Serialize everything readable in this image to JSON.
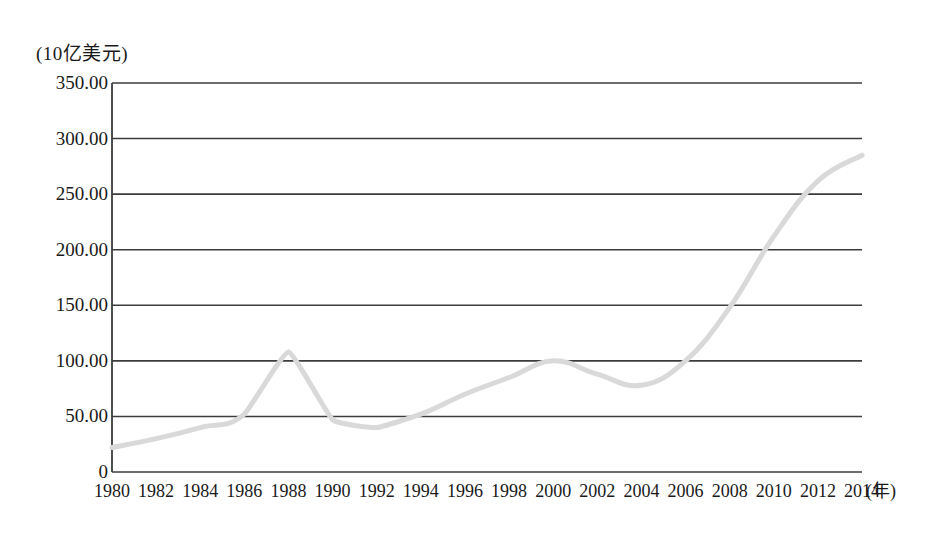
{
  "chart_data": {
    "type": "line",
    "title": "",
    "subtitle": "",
    "unit_label": "(10亿美元)",
    "xlabel": "(年)",
    "ylabel": "",
    "xlim": [
      1980,
      2014
    ],
    "ylim": [
      0,
      350
    ],
    "grid": true,
    "legend": false,
    "legend_position": "none",
    "line_color": "#d9d9d9",
    "axis_color": "#3c3c3c",
    "x_tick_labels": [
      "1980",
      "1982",
      "1984",
      "1986",
      "1988",
      "1990",
      "1992",
      "1994",
      "1996",
      "1998",
      "2000",
      "2002",
      "2004",
      "2006",
      "2008",
      "2010",
      "2012",
      "2014"
    ],
    "y_tick_labels": [
      "0",
      "50.00",
      "100.00",
      "150.00",
      "200.00",
      "250.00",
      "300.00",
      "350.00"
    ],
    "y_tick_values": [
      0,
      50,
      100,
      150,
      200,
      250,
      300,
      350
    ],
    "x": [
      1980,
      1982,
      1984,
      1986,
      1988,
      1990,
      1992,
      1994,
      1996,
      1998,
      2000,
      2002,
      2004,
      2006,
      2008,
      2010,
      2012,
      2014
    ],
    "values": [
      22,
      30,
      40,
      52,
      108,
      47,
      40,
      52,
      70,
      85,
      100,
      88,
      78,
      100,
      148,
      212,
      262,
      285
    ],
    "series": [
      {
        "name": "",
        "values": [
          22,
          30,
          40,
          52,
          108,
          47,
          40,
          52,
          70,
          85,
          100,
          88,
          78,
          100,
          148,
          212,
          262,
          285
        ]
      }
    ],
    "annotations": []
  }
}
